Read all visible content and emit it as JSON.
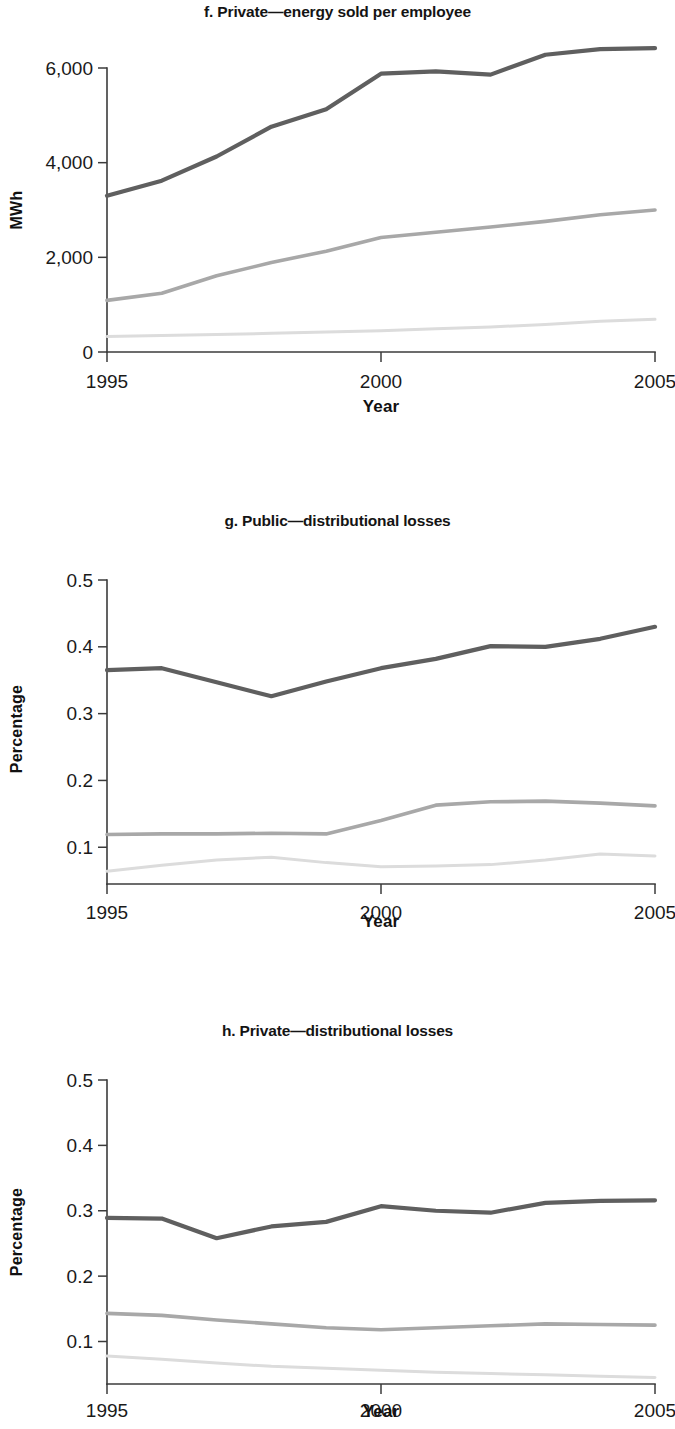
{
  "figure": {
    "panels": [
      {
        "id": "f",
        "title": "f. Private—energy sold per employee",
        "chart_data": {
          "type": "line",
          "title": "f. Private—energy sold per employee",
          "xlabel": "Year",
          "ylabel": "MWh",
          "x": [
            1995,
            1996,
            1997,
            1998,
            1999,
            2000,
            2001,
            2002,
            2003,
            2004,
            2005
          ],
          "xlim": [
            1995,
            2005
          ],
          "ylim": [
            0,
            6000
          ],
          "xticks": [
            1995,
            2000,
            2005
          ],
          "xticklabels": [
            "1995",
            "2000",
            "2005"
          ],
          "yticks": [
            0,
            2000,
            4000,
            6000
          ],
          "yticklabels": [
            "0",
            "2,000",
            "4,000",
            "6,000"
          ],
          "grid": false,
          "legend": "none",
          "series": [
            {
              "name": "upper",
              "color": "#5f5f5f",
              "width": 4.2,
              "values": [
                3300,
                3620,
                4130,
                4760,
                5130,
                5880,
                5930,
                5860,
                6280,
                6400,
                6420
              ]
            },
            {
              "name": "middle",
              "color": "#a8a8a8",
              "width": 3.6,
              "values": [
                1090,
                1240,
                1610,
                1890,
                2130,
                2420,
                2530,
                2640,
                2760,
                2900,
                3000
              ]
            },
            {
              "name": "lower",
              "color": "#dcdcdc",
              "width": 3.0,
              "values": [
                330,
                350,
                370,
                395,
                420,
                450,
                490,
                530,
                580,
                650,
                690
              ]
            }
          ]
        }
      },
      {
        "id": "g",
        "title": "g. Public—distributional losses",
        "chart_data": {
          "type": "line",
          "title": "g. Public—distributional losses",
          "xlabel": "Year",
          "ylabel": "Percentage",
          "x": [
            1995,
            1996,
            1997,
            1998,
            1999,
            2000,
            2001,
            2002,
            2003,
            2004,
            2005
          ],
          "xlim": [
            1995,
            2005
          ],
          "ylim": [
            0.045,
            0.5
          ],
          "xticks": [
            1995,
            2000,
            2005
          ],
          "xticklabels": [
            "1995",
            "2000",
            "2005"
          ],
          "yticks": [
            0.1,
            0.2,
            0.3,
            0.4,
            0.5
          ],
          "yticklabels": [
            "0.1",
            "0.2",
            "0.3",
            "0.4",
            "0.5"
          ],
          "grid": false,
          "legend": "none",
          "series": [
            {
              "name": "upper",
              "color": "#5f5f5f",
              "width": 4.2,
              "values": [
                0.365,
                0.368,
                0.347,
                0.326,
                0.348,
                0.368,
                0.382,
                0.401,
                0.4,
                0.412,
                0.43
              ]
            },
            {
              "name": "middle",
              "color": "#a8a8a8",
              "width": 3.6,
              "values": [
                0.119,
                0.12,
                0.12,
                0.121,
                0.12,
                0.14,
                0.163,
                0.168,
                0.169,
                0.166,
                0.162
              ]
            },
            {
              "name": "lower",
              "color": "#dcdcdc",
              "width": 3.0,
              "values": [
                0.064,
                0.073,
                0.081,
                0.085,
                0.077,
                0.071,
                0.072,
                0.074,
                0.081,
                0.09,
                0.087
              ]
            }
          ]
        }
      },
      {
        "id": "h",
        "title": "h. Private—distributional losses",
        "chart_data": {
          "type": "line",
          "title": "h. Private—distributional losses",
          "xlabel": "Year",
          "ylabel": "Percentage",
          "x": [
            1995,
            1996,
            1997,
            1998,
            1999,
            2000,
            2001,
            2002,
            2003,
            2004,
            2005
          ],
          "xlim": [
            1995,
            2005
          ],
          "ylim": [
            0.035,
            0.5
          ],
          "xticks": [
            1995,
            2000,
            2005
          ],
          "xticklabels": [
            "1995",
            "2000",
            "2005"
          ],
          "yticks": [
            0.1,
            0.2,
            0.3,
            0.4,
            0.5
          ],
          "yticklabels": [
            "0.1",
            "0.2",
            "0.3",
            "0.4",
            "0.5"
          ],
          "grid": false,
          "legend": "none",
          "series": [
            {
              "name": "upper",
              "color": "#5f5f5f",
              "width": 4.2,
              "values": [
                0.289,
                0.288,
                0.258,
                0.276,
                0.283,
                0.307,
                0.3,
                0.297,
                0.312,
                0.315,
                0.316
              ]
            },
            {
              "name": "middle",
              "color": "#a8a8a8",
              "width": 3.6,
              "values": [
                0.143,
                0.14,
                0.133,
                0.127,
                0.121,
                0.118,
                0.121,
                0.124,
                0.127,
                0.126,
                0.125
              ]
            },
            {
              "name": "lower",
              "color": "#dcdcdc",
              "width": 3.0,
              "values": [
                0.078,
                0.073,
                0.067,
                0.062,
                0.059,
                0.056,
                0.053,
                0.051,
                0.049,
                0.047,
                0.045
              ]
            }
          ]
        }
      }
    ]
  }
}
